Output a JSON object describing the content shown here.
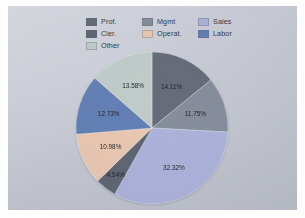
{
  "legend": {
    "entries": [
      {
        "label": "Prof.",
        "color": "#5e6472"
      },
      {
        "label": "Mgmt",
        "color": "#808796"
      },
      {
        "label": "Sales",
        "color": "#a9aed8"
      },
      {
        "label": "Cler.",
        "color": "#575d6b"
      },
      {
        "label": "Operat.",
        "color": "#e8c5ae"
      },
      {
        "label": "Labor",
        "color": "#5b79b0"
      },
      {
        "label": "Other",
        "color": "#bdc9c6"
      }
    ]
  },
  "chart_data": {
    "type": "pie",
    "title": "",
    "legend_position": "top",
    "categories": [
      "Prof.",
      "Mgmt",
      "Sales",
      "Cler.",
      "Operat.",
      "Labor",
      "Other"
    ],
    "values": [
      14.11,
      11.75,
      32.32,
      4.54,
      10.98,
      12.73,
      13.58
    ],
    "labels": [
      "14.11%",
      "11.75%",
      "32.32%",
      "4.54%",
      "10.98%",
      "12.73%",
      "13.58%"
    ],
    "colors": [
      "#5e6472",
      "#808796",
      "#a9aed8",
      "#575d6b",
      "#e8c5ae",
      "#5b79b0",
      "#bdc9c6"
    ],
    "units": "percent",
    "total": 100.01,
    "start_angle_deg": 0,
    "direction": "clockwise"
  },
  "colors": {
    "chart_background": "#c6c9d2",
    "page_background": "#fdfdfd",
    "label_text": "#15171c"
  }
}
